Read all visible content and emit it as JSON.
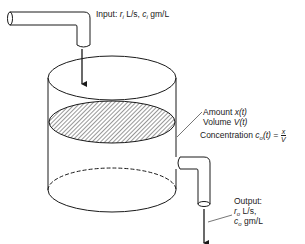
{
  "diagram": {
    "type": "mixing-tank",
    "input": {
      "prefix": "Input:",
      "rate_symbol": "r",
      "rate_sub": "i",
      "rate_unit": "L/s,",
      "conc_symbol": "c",
      "conc_sub": "i",
      "conc_unit": "gm/L"
    },
    "tank": {
      "amount_label": "Amount",
      "amount_expr": "x(t)",
      "volume_label": "Volume",
      "volume_expr": "V(t)",
      "concentration_label": "Concentration",
      "concentration_symbol": "c",
      "concentration_sub": "o",
      "concentration_arg": "(t) =",
      "fraction_num": "x",
      "fraction_den": "V"
    },
    "output": {
      "title": "Output:",
      "rate_symbol": "r",
      "rate_sub": "o",
      "rate_unit": "L/s,",
      "conc_symbol": "c",
      "conc_sub": "o",
      "conc_unit": "gm/L"
    },
    "colors": {
      "stroke": "#1a1a1a",
      "background": "#ffffff"
    }
  }
}
